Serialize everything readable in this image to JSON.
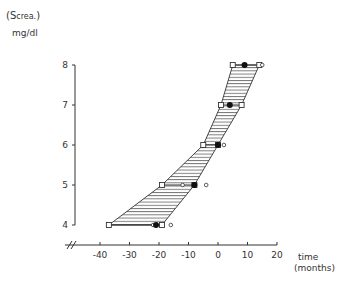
{
  "chart_data": {
    "type": "area",
    "title": "",
    "ylabel_line1_prefix": "(S",
    "ylabel_line1_sub": "crea.",
    "ylabel_line1_suffix": ")",
    "ylabel_line2": "mg/dl",
    "xlabel_line1": "time",
    "xlabel_line2": "(months)",
    "x_ticks": [
      -40,
      -30,
      -20,
      -10,
      0,
      10,
      20
    ],
    "x_tick_labels": [
      "-40",
      "-30",
      "-20",
      "-10",
      "0",
      "10",
      "20"
    ],
    "y_ticks": [
      4,
      5,
      6,
      7,
      8
    ],
    "y_tick_labels": [
      "4",
      "5",
      "6",
      "7",
      "8"
    ],
    "xlim": [
      -46,
      20
    ],
    "ylim": [
      4,
      8
    ],
    "axis_break": "x-axis broken left of -40",
    "band": {
      "y": [
        4,
        5,
        6,
        7,
        8
      ],
      "left": [
        -37,
        -19,
        -5,
        1,
        5
      ],
      "right": [
        -19,
        -8,
        0,
        8,
        14
      ]
    },
    "series": [
      {
        "name": "filled-dot (mean)",
        "marker": "filled-circle",
        "points": [
          [
            -21,
            4
          ],
          [
            -8,
            5
          ],
          [
            0,
            6
          ],
          [
            4,
            7
          ],
          [
            9,
            8
          ]
        ]
      },
      {
        "name": "open-square (band limits)",
        "marker": "open-square",
        "points": [
          [
            -37,
            4
          ],
          [
            -19,
            4
          ],
          [
            -19,
            5
          ],
          [
            -8,
            5
          ],
          [
            -5,
            6
          ],
          [
            0,
            6
          ],
          [
            1,
            7
          ],
          [
            8,
            7
          ],
          [
            5,
            8
          ],
          [
            14,
            8
          ]
        ]
      },
      {
        "name": "open-circle (individual)",
        "marker": "open-circle",
        "points": [
          [
            -22,
            4
          ],
          [
            -16,
            4
          ],
          [
            -12,
            5
          ],
          [
            -4,
            5
          ],
          [
            2,
            6
          ],
          [
            15,
            8
          ]
        ]
      }
    ],
    "grid": false,
    "legend": "none"
  }
}
